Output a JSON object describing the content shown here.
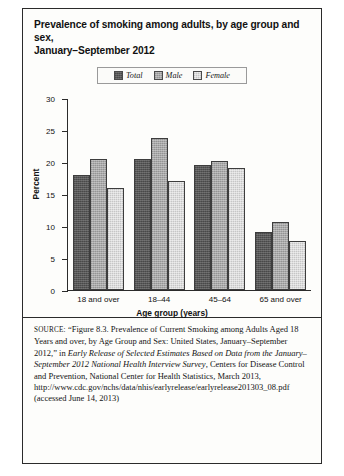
{
  "figure": {
    "title_line1": "Prevalence of smoking among adults, by age group and sex,",
    "title_line2": "January–September 2012"
  },
  "legend": {
    "items": [
      {
        "label": "Total",
        "swatch": "legend-swatch-total",
        "color": "#575757"
      },
      {
        "label": "Male",
        "swatch": "legend-swatch-male",
        "color": "#a8a8a8"
      },
      {
        "label": "Female",
        "swatch": "legend-swatch-female",
        "color": "#dcdcdc"
      }
    ]
  },
  "axes": {
    "y_ticks": [
      "30",
      "25",
      "20",
      "15",
      "10",
      "5",
      "0"
    ]
  },
  "source": {
    "label": "SOURCE:",
    "part1": "“Figure 8.3. Prevalence of Current Smoking among Adults Aged 18 Years and over, by Age Group and Sex: United States, January–September 2012,” in ",
    "italic1": "Early Release of Selected Estimates Based on Data from the January–September 2012 National Health Interview Survey",
    "part2": ", Centers for Disease Control and Prevention, National Center for Health Statistics, March 2013, http://www.cdc.gov/nchs/data/nhis/earlyrelease/earlyrelease201303_08.pdf (accessed June 14, 2013)"
  },
  "chart_data": {
    "type": "bar",
    "title": "Prevalence of smoking among adults, by age group and sex, January–September 2012",
    "xlabel": "Age group (years)",
    "ylabel": "Percent",
    "ylim": [
      0,
      30
    ],
    "ytick_step": 5,
    "grid": false,
    "legend_position": "top-center",
    "categories": [
      "18 and over",
      "18–44",
      "45–64",
      "65 and over"
    ],
    "series": [
      {
        "name": "Total",
        "color": "#575757",
        "values": [
          18.0,
          20.4,
          19.5,
          9.0
        ]
      },
      {
        "name": "Male",
        "color": "#a8a8a8",
        "values": [
          20.4,
          23.8,
          20.1,
          10.7
        ]
      },
      {
        "name": "Female",
        "color": "#dcdcdc",
        "values": [
          16.0,
          17.1,
          19.0,
          7.7
        ]
      }
    ]
  }
}
